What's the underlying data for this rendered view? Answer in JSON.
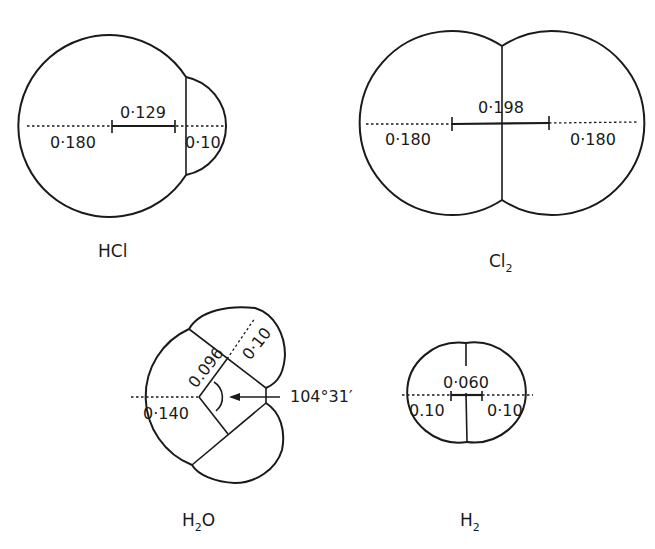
{
  "figure": {
    "molecules": [
      {
        "id": "hcl",
        "name": "HCl",
        "name_parts": {
          "base": "HCl",
          "sub": "",
          "tail": ""
        },
        "labels": {
          "bond_length": "0·129",
          "cl_radius": "0·180",
          "h_radius": "0·10"
        }
      },
      {
        "id": "cl2",
        "name": "Cl2",
        "name_parts": {
          "base": "Cl",
          "sub": "2",
          "tail": ""
        },
        "labels": {
          "bond_length": "0·198",
          "left_radius": "0·180",
          "right_radius": "0·180"
        }
      },
      {
        "id": "h2o",
        "name": "H2O",
        "name_parts": {
          "base": "H",
          "sub": "2",
          "tail": "O"
        },
        "labels": {
          "bond_length": "0.096",
          "o_radius": "0·140",
          "h_radius": "0·10",
          "bond_angle": "104°31′"
        }
      },
      {
        "id": "h2",
        "name": "H2",
        "name_parts": {
          "base": "H",
          "sub": "2",
          "tail": ""
        },
        "labels": {
          "bond_length": "0·060",
          "left_radius": "0.10",
          "right_radius": "0·10"
        }
      }
    ]
  }
}
